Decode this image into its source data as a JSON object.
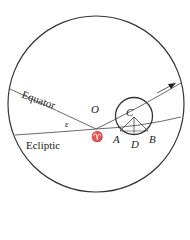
{
  "diagram": {
    "type": "celestial-sphere",
    "great_circles": [
      {
        "name": "Equator",
        "label": "Equator"
      },
      {
        "name": "Ecliptic",
        "label": "Ecliptic"
      }
    ],
    "points": {
      "center": "O",
      "epicycle_center": "C",
      "vernal_equinox": "♈",
      "a": "A",
      "b": "B",
      "d": "D"
    },
    "angle_label": "ε",
    "colors": {
      "stroke": "#333333",
      "background": "#ffffff"
    }
  }
}
